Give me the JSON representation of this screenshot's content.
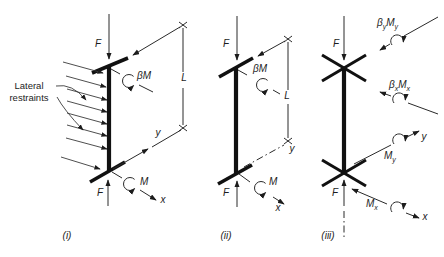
{
  "colors": {
    "ink": "#1c1c1c",
    "background": "#ffffff"
  },
  "labels": {
    "lateral_restraints_line1": "Lateral",
    "lateral_restraints_line2": "restraints"
  },
  "sym": {
    "F": "F",
    "M": "M",
    "beta_M": "βM",
    "beta": "β",
    "L": "L",
    "x": "x",
    "y": "y"
  },
  "captions": {
    "i": "(i)",
    "ii": "(ii)",
    "iii": "(iii)"
  }
}
